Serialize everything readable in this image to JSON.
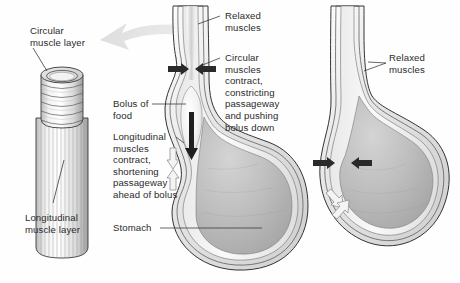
{
  "figure": {
    "background_color": "#fefefe",
    "text_color": "#2b2b2b"
  },
  "panels": {
    "muscle_layer_cylinder": {
      "name": "esophagus muscle layer cutaway",
      "labels": {
        "circular": "Circular\nmuscle layer",
        "longitudinal": "Longitudinal\nmuscle layer"
      },
      "colors": {
        "circular_band": "#d9d9d9",
        "longitudinal_stripe": "#ededed",
        "outline": "#3a3a3a"
      }
    },
    "middle_diagram": {
      "name": "esophagus with bolus peristaltic wave",
      "labels": {
        "relaxed_muscles": "Relaxed\nmuscles",
        "circular_contract": "Circular\nmuscles\ncontract,\nconstricting\npassageway\nand pushing\nbolus down",
        "bolus_of_food": "Bolus of\nfood",
        "longitudinal_contract": "Longitudinal\nmuscles\ncontract,\nshortening\npassageway\nahead of bolus",
        "stomach": "Stomach"
      },
      "colors": {
        "lumen": "#f4f4f4",
        "wall": "#cfcfcf",
        "bolus": "#f7f7f7",
        "stomach_fill": "#bcbcbc",
        "outline": "#333333",
        "solid_arrow": "#2a2a2a",
        "hollow_arrow": "#f2f2f2"
      }
    },
    "right_diagram": {
      "name": "esophagus after bolus passed",
      "labels": {
        "relaxed_muscles": "Relaxed\nmuscles"
      },
      "colors": {
        "lumen": "#f4f4f4",
        "wall": "#cfcfcf",
        "stomach_fill": "#bcbcbc",
        "outline": "#333333"
      }
    }
  },
  "arrows": {
    "transition_arrow": {
      "name": "curved gray pointer from diagram to cutaway",
      "direction": "left",
      "color": "#d5d5d5"
    },
    "constriction_arrows_middle": {
      "count": 2,
      "direction": "inward",
      "color": "#2a2a2a"
    },
    "constriction_arrows_right": {
      "count": 2,
      "direction": "inward",
      "color": "#2a2a2a"
    },
    "bolus_push_arrow": {
      "direction": "down",
      "color": "#1f1f1f"
    },
    "shortening_arrows_middle": {
      "count": 2,
      "direction": "down-and-up",
      "color": "#f2f2f2"
    },
    "shortening_arrows_right": {
      "count": 2,
      "direction": "diagonal",
      "color": "#f2f2f2"
    }
  }
}
